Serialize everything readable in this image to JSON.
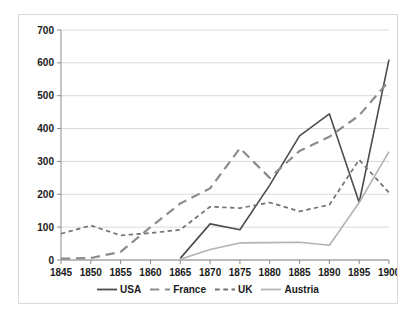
{
  "chart_data": {
    "type": "line",
    "title": "",
    "subtitle": "",
    "xlabel": "",
    "ylabel": "",
    "xlim": [
      1845,
      1900
    ],
    "ylim": [
      0,
      700
    ],
    "ytick_step": 100,
    "grid": true,
    "grid_axis": "y",
    "legend_position": "bottom",
    "x": [
      1845,
      1850,
      1855,
      1860,
      1865,
      1870,
      1875,
      1880,
      1885,
      1890,
      1895,
      1900
    ],
    "categories": [
      "1845",
      "1850",
      "1855",
      "1860",
      "1865",
      "1870",
      "1875",
      "1880",
      "1885",
      "1890",
      "1895",
      "1900"
    ],
    "ytick_labels": [
      "0",
      "100",
      "200",
      "300",
      "400",
      "500",
      "600",
      "700"
    ],
    "ytick_values": [
      0,
      100,
      200,
      300,
      400,
      500,
      600,
      700
    ],
    "series": [
      {
        "name": "USA",
        "color": "#4d4d4d",
        "style": "solid",
        "width": 1.6,
        "x": [
          1865,
          1870,
          1875,
          1880,
          1885,
          1890,
          1895,
          1900
        ],
        "values": [
          5,
          110,
          92,
          228,
          378,
          445,
          175,
          610
        ]
      },
      {
        "name": "France",
        "color": "#8c8c8c",
        "style": "long-dash",
        "width": 2.2,
        "x": [
          1845,
          1850,
          1855,
          1860,
          1865,
          1870,
          1875,
          1880,
          1885,
          1890,
          1895,
          1900
        ],
        "values": [
          4,
          6,
          25,
          100,
          172,
          218,
          340,
          250,
          332,
          375,
          440,
          545
        ]
      },
      {
        "name": "UK",
        "color": "#737373",
        "style": "short-dash",
        "width": 1.7,
        "x": [
          1845,
          1850,
          1855,
          1860,
          1865,
          1870,
          1875,
          1880,
          1885,
          1890,
          1895,
          1900
        ],
        "values": [
          80,
          105,
          75,
          82,
          92,
          162,
          158,
          175,
          148,
          168,
          305,
          205
        ]
      },
      {
        "name": "Austria",
        "color": "#b3b3b3",
        "style": "solid",
        "width": 1.6,
        "x": [
          1865,
          1870,
          1875,
          1880,
          1885,
          1890,
          1895,
          1900
        ],
        "values": [
          2,
          32,
          52,
          53,
          54,
          45,
          175,
          330
        ]
      }
    ]
  },
  "legend": {
    "items": [
      {
        "label": "USA",
        "color": "#4d4d4d",
        "style": "solid"
      },
      {
        "label": "France",
        "color": "#8c8c8c",
        "style": "long-dash"
      },
      {
        "label": "UK",
        "color": "#737373",
        "style": "short-dash"
      },
      {
        "label": "Austria",
        "color": "#b3b3b3",
        "style": "solid"
      }
    ]
  },
  "colors": {
    "background": "#ffffff",
    "border": "#d9d9d9",
    "grid": "#c9c9c9",
    "axis": "#8c8c8c",
    "text": "#1a1a1a"
  }
}
